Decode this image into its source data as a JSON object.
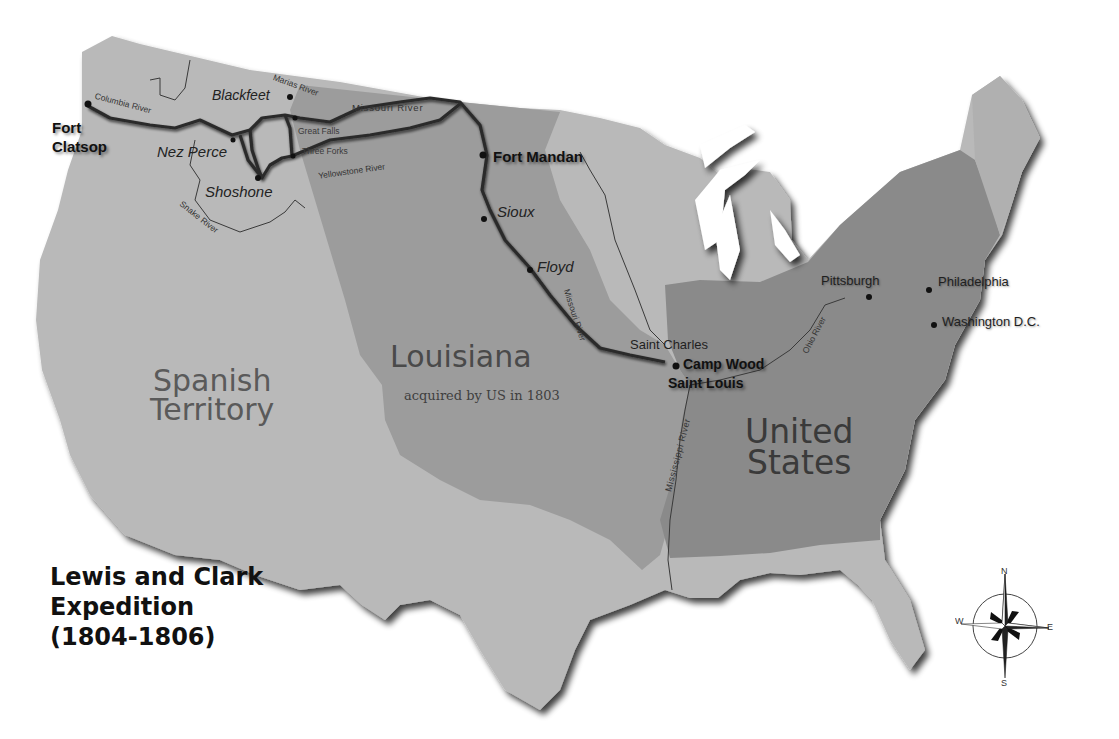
{
  "title": {
    "line1": "Lewis and Clark",
    "line2": "Expedition",
    "line3": "(1804-1806)"
  },
  "regions": {
    "spanish": {
      "line1": "Spanish",
      "line2": "Territory",
      "color": "#b4b4b4"
    },
    "louisiana": {
      "name": "Louisiana",
      "note": "acquired by US in 1803",
      "color": "#9c9c9c"
    },
    "united_states": {
      "line1": "United",
      "line2": "States",
      "color": "#8a8a8a"
    },
    "other_land_color": "#b9b9b9",
    "route_color": "#2b2b2b"
  },
  "forts": {
    "fort_clatsop": {
      "line1": "Fort",
      "line2": "Clatsop"
    },
    "fort_mandan": "Fort Mandan",
    "camp_wood": "Camp Wood",
    "saint_louis": "Saint Louis"
  },
  "tribes": {
    "blackfeet": "Blackfeet",
    "nez_perce": "Nez Perce",
    "shoshone": "Shoshone",
    "sioux": "Sioux",
    "floyd": "Floyd"
  },
  "places": {
    "great_falls": "Great Falls",
    "three_forks": "Three Forks",
    "saint_charles": "Saint Charles",
    "pittsburgh": "Pittsburgh",
    "philadelphia": "Philadelphia",
    "washington_dc": "Washington D.C."
  },
  "rivers": {
    "columbia": "Columbia River",
    "marias": "Marias River",
    "missouri_north": "Missouri River",
    "yellowstone": "Yellowstone River",
    "snake": "Snake River",
    "missouri_south": "Missouri River",
    "mississippi": "Mississippi River",
    "ohio": "Ohio River"
  },
  "compass": {
    "n": "N",
    "s": "S",
    "e": "E",
    "w": "W"
  }
}
